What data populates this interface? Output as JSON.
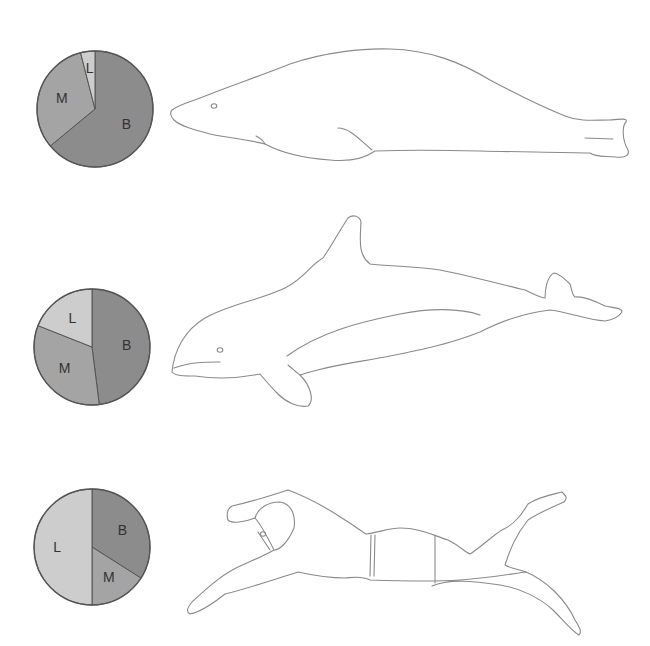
{
  "colors": {
    "B": "#8c8c8c",
    "M": "#a4a4a4",
    "L": "#cdcdcd",
    "outline": "#555555",
    "figure_stroke": "#8a8a8a"
  },
  "rows": [
    {
      "figure": "manatee-like marine mammal",
      "pie": {
        "slices": [
          {
            "label": "B",
            "percent": 64
          },
          {
            "label": "M",
            "percent": 32
          },
          {
            "label": "L",
            "percent": 4
          }
        ]
      }
    },
    {
      "figure": "dolphin / porpoise",
      "pie": {
        "slices": [
          {
            "label": "B",
            "percent": 48
          },
          {
            "label": "M",
            "percent": 33
          },
          {
            "label": "L",
            "percent": 19
          }
        ]
      }
    },
    {
      "figure": "human swimmer",
      "pie": {
        "slices": [
          {
            "label": "B",
            "percent": 34
          },
          {
            "label": "M",
            "percent": 16
          },
          {
            "label": "L",
            "percent": 50
          }
        ]
      }
    }
  ],
  "chart_data": [
    {
      "type": "pie",
      "title": "",
      "categories": [
        "B",
        "M",
        "L"
      ],
      "values": [
        64,
        32,
        4
      ]
    },
    {
      "type": "pie",
      "title": "",
      "categories": [
        "B",
        "M",
        "L"
      ],
      "values": [
        48,
        33,
        19
      ]
    },
    {
      "type": "pie",
      "title": "",
      "categories": [
        "B",
        "M",
        "L"
      ],
      "values": [
        34,
        16,
        50
      ]
    }
  ]
}
